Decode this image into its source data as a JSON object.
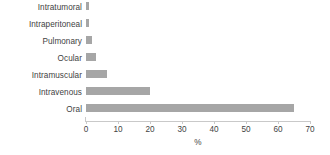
{
  "chart_data": {
    "type": "bar",
    "orientation": "horizontal",
    "title": "",
    "xlabel": "%",
    "ylabel": "",
    "categories": [
      "Intratumoral",
      "Intraperitoneal",
      "Pulmonary",
      "Ocular",
      "Intramuscular",
      "Intravenous",
      "Oral"
    ],
    "values": [
      1,
      1,
      2,
      3,
      6.5,
      20,
      65
    ],
    "xlim": [
      0,
      70
    ],
    "xticks": [
      0,
      10,
      20,
      30,
      40,
      50,
      60,
      70
    ],
    "xtick_labels": [
      "0",
      "10",
      "20",
      "30",
      "40",
      "50",
      "60",
      "70"
    ],
    "grid": false,
    "legend": false,
    "bar_color": "#a6a6a6",
    "axis_color": "#c9c9c9",
    "text_color": "#3f3f3f"
  }
}
